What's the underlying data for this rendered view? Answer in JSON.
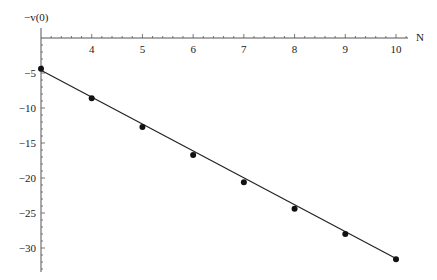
{
  "chart_data": {
    "type": "scatter",
    "title": "",
    "xlabel": "N",
    "ylabel": "−v(0)",
    "x": [
      3,
      4,
      5,
      6,
      7,
      8,
      9,
      10
    ],
    "series": [
      {
        "name": "data",
        "style": "points",
        "values": [
          -4.4,
          -8.6,
          -12.7,
          -16.7,
          -20.6,
          -24.4,
          -28.0,
          -31.6
        ]
      },
      {
        "name": "linear fit",
        "style": "line",
        "x": [
          3,
          10
        ],
        "values": [
          -4.6,
          -31.5
        ]
      }
    ],
    "x_ticks": [
      4,
      5,
      6,
      7,
      8,
      9,
      10
    ],
    "y_ticks": [
      -5,
      -10,
      -15,
      -20,
      -25,
      -30
    ],
    "x_tick_labels": [
      "4",
      "5",
      "6",
      "7",
      "8",
      "9",
      "10"
    ],
    "y_tick_labels": [
      "−5",
      "−10",
      "−15",
      "−20",
      "−25",
      "−30"
    ],
    "xlim": [
      3,
      10.2
    ],
    "ylim": [
      -33,
      0
    ],
    "grid": false,
    "legend": null
  },
  "colors": {
    "axis": "#555555",
    "points": "#111111",
    "line": "#222222"
  }
}
